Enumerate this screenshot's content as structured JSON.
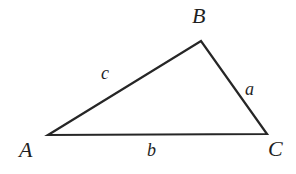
{
  "figure": {
    "kind": "geometry-diagram",
    "shape": "triangle",
    "background_color": "#ffffff",
    "stroke_color": "#262626",
    "stroke_width": 2.2,
    "text_color": "#1f1f1f",
    "vertices": [
      {
        "id": "A",
        "label": "A",
        "x": 48,
        "y": 135
      },
      {
        "id": "B",
        "label": "B",
        "x": 201,
        "y": 41
      },
      {
        "id": "C",
        "label": "C",
        "x": 267,
        "y": 134
      }
    ],
    "sides": [
      {
        "id": "a",
        "label": "a",
        "from": "B",
        "to": "C",
        "label_x": 245,
        "label_y": 80
      },
      {
        "id": "b",
        "label": "b",
        "from": "A",
        "to": "C",
        "label_x": 147,
        "label_y": 141
      },
      {
        "id": "c",
        "label": "c",
        "from": "A",
        "to": "B",
        "label_x": 101,
        "label_y": 64
      }
    ],
    "vertex_labels": {
      "A": {
        "text": "A",
        "x": 19,
        "y": 139
      },
      "B": {
        "text": "B",
        "x": 192,
        "y": 5
      },
      "C": {
        "text": "C",
        "x": 268,
        "y": 138
      }
    }
  }
}
